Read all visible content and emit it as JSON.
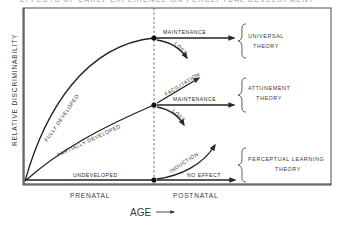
{
  "title": "EFFECTS OF EARLY EXPERIENCE ON PERCEPTUAL DEVELOPMENT",
  "axes": {
    "y_label": "RELATIVE DISCRIMINABILITY",
    "x_period_left": "PRENATAL",
    "x_period_right": "POSTNATAL",
    "x_label": "AGE"
  },
  "curves": [
    {
      "name": "fully-developed",
      "label": "FULLY DEVELOPED",
      "outcomes": [
        "MAINTENANCE",
        "LOSS"
      ]
    },
    {
      "name": "partially-developed",
      "label": "PARTIALLY DEVELOPED",
      "outcomes": [
        "FACILITATION",
        "MAINTENANCE",
        "LOSS"
      ]
    },
    {
      "name": "undeveloped",
      "label": "UNDEVELOPED",
      "outcomes": [
        "INDUCTION",
        "NO EFFECT"
      ]
    }
  ],
  "theories": [
    {
      "line1": "UNIVERSAL",
      "line2": "THEORY"
    },
    {
      "line1": "ATTUNEMENT",
      "line2": "THEORY"
    },
    {
      "line1": "PERCEPTUAL LEARNING",
      "line2": "THEORY"
    }
  ],
  "colors": {
    "ink": "#2a2a2a",
    "frame": "#4a4a4a",
    "background": "#ffffff"
  }
}
